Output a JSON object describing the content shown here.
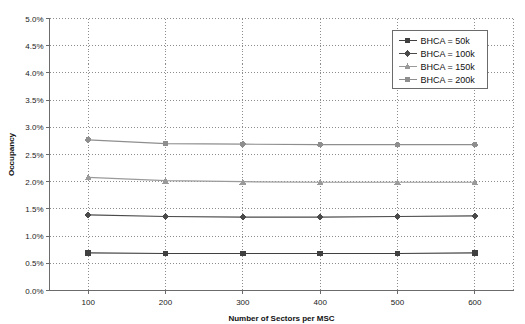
{
  "chart_data": {
    "type": "line",
    "title": "",
    "xlabel": "Number of Sectors per MSC",
    "ylabel": "Occupancy",
    "x": [
      100,
      200,
      300,
      400,
      500,
      600
    ],
    "xlim": [
      50,
      650
    ],
    "xticks": [
      100,
      200,
      300,
      400,
      500,
      600
    ],
    "xtick_labels": [
      "100",
      "200",
      "300",
      "400",
      "500",
      "600"
    ],
    "ylim": [
      0.0,
      5.0
    ],
    "yticks": [
      0.0,
      0.5,
      1.0,
      1.5,
      2.0,
      2.5,
      3.0,
      3.5,
      4.0,
      4.5,
      5.0
    ],
    "ytick_labels": [
      "0.0%",
      "0.5%",
      "1.0%",
      "1.5%",
      "2.0%",
      "2.5%",
      "3.0%",
      "3.5%",
      "4.0%",
      "4.5%",
      "5.0%"
    ],
    "grid": true,
    "grid_style": "dotted",
    "legend_position": "top-right",
    "series": [
      {
        "name": "BHCA = 50k",
        "marker": "square",
        "color": "#404040",
        "values": [
          0.69,
          0.68,
          0.68,
          0.68,
          0.68,
          0.69
        ]
      },
      {
        "name": "BHCA = 100k",
        "marker": "diamond",
        "color": "#4a4a4a",
        "values": [
          1.39,
          1.36,
          1.35,
          1.35,
          1.36,
          1.37
        ]
      },
      {
        "name": "BHCA = 150k",
        "marker": "triangle",
        "color": "#9a9a9a",
        "values": [
          2.08,
          2.02,
          2.0,
          1.99,
          1.99,
          1.99
        ]
      },
      {
        "name": "BHCA = 200k",
        "marker": "circle",
        "color": "#8e8e8e",
        "values": [
          2.77,
          2.7,
          2.69,
          2.68,
          2.68,
          2.68
        ]
      }
    ]
  },
  "legend": {
    "items": [
      {
        "label": "BHCA = 50k"
      },
      {
        "label": "BHCA = 100k"
      },
      {
        "label": "BHCA = 150k"
      },
      {
        "label": "BHCA = 200k"
      }
    ]
  },
  "colors": {
    "axis": "#6b6b6b",
    "grid": "#8c8c8c",
    "text": "#111111",
    "legend_border": "#6b6b6b",
    "background": "#ffffff"
  }
}
